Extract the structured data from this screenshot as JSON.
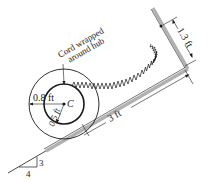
{
  "figure": {
    "type": "mechanics-diagram",
    "colors": {
      "line": "#1a1a1a",
      "surface": "#b0b0b0",
      "background": "#ffffff"
    }
  },
  "labels": {
    "cord_annotation_line1": "Cord wrapped",
    "cord_annotation_line2": "around hub",
    "center_label": "C",
    "outer_radius": "0.8 ft",
    "hub_radius": "0.5 ft",
    "incline_distance": "3 ft",
    "wall_distance": "1.3 ft",
    "slope_rise": "3",
    "slope_run": "4"
  },
  "geometry": {
    "outer_radius_ft": 0.8,
    "hub_radius_ft": 0.5,
    "distance_along_incline_ft": 3,
    "spring_attach_height_ft": 1.3,
    "slope": {
      "rise": 3,
      "run": 4
    }
  }
}
